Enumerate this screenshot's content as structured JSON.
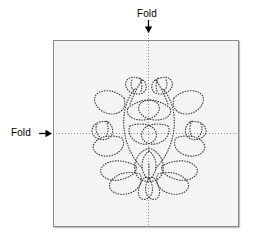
{
  "figure": {
    "type": "sewing-pattern-diagram",
    "background_color": "#ffffff"
  },
  "fabric": {
    "name": "fabric-square",
    "fill_color": "#f4f4f4",
    "border_color": "#8a8a8a",
    "x": 53,
    "y": 40,
    "width": 186,
    "height": 187
  },
  "folds": {
    "vertical": {
      "label": "Fold",
      "arrow_direction": "down",
      "line_color": "#8e8e8e",
      "line_style": "dotted",
      "position_x": 148
    },
    "horizontal": {
      "label": "Fold",
      "arrow_direction": "right",
      "line_color": "#8e8e8e",
      "line_style": "dotted",
      "position_y": 133
    }
  },
  "motif": {
    "name": "floral-wreath-motif",
    "stroke_color": "#3c3c3c",
    "line_style": "dotted",
    "symmetry": "bilateral-vertical",
    "elements": [
      "center-flower",
      "lower-petals",
      "side-leaves",
      "upper-tulip-buds",
      "side-tulip-buds",
      "curved-stems"
    ]
  }
}
